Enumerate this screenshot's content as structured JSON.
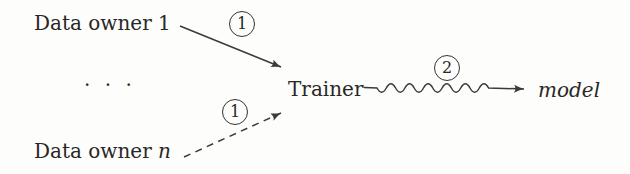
{
  "meta": {
    "background": "#fdfdfc",
    "ink_color": "#2a2824",
    "line_color": "#3d3b37",
    "diagram_type": "flow-diagram"
  },
  "nodes": {
    "data_owner_1": {
      "label": "Data owner 1"
    },
    "ellipsis": {
      "label": ". . ."
    },
    "data_owner_n": {
      "prefix": "Data owner ",
      "var": "n"
    },
    "trainer": {
      "label": "Trainer"
    },
    "model": {
      "label": "model"
    }
  },
  "steps": {
    "step1_top": "1",
    "step1_bottom": "1",
    "step2": "2"
  },
  "edges": [
    {
      "from": "data_owner_1",
      "to": "trainer",
      "style": "solid-arrow",
      "step": "1"
    },
    {
      "from": "data_owner_n",
      "to": "trainer",
      "style": "dashed-arrow",
      "step": "1"
    },
    {
      "from": "trainer",
      "to": "model",
      "style": "wavy-arrow",
      "step": "2"
    }
  ]
}
